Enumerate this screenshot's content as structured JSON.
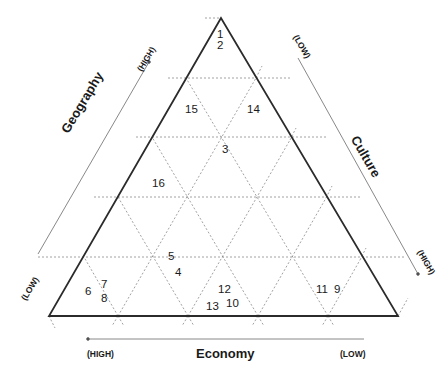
{
  "diagram": {
    "type": "ternary-triangle",
    "grid_divisions": 5,
    "colors": {
      "frame": "#2b2b2b",
      "grid": "#8a8a8a",
      "axis_line": "#7a7a7a",
      "text": "#1a1a1a"
    },
    "axes": {
      "geography": {
        "title": "Geography",
        "high": "(HIGH)",
        "low": "(LOW)"
      },
      "culture": {
        "title": "Culture",
        "high": "(HIGH)",
        "low": "(LOW)"
      },
      "economy": {
        "title": "Economy",
        "high": "(HIGH)",
        "low": "(LOW)"
      }
    },
    "points": [
      {
        "id": "1",
        "label": "1"
      },
      {
        "id": "2",
        "label": "2"
      },
      {
        "id": "3",
        "label": "3"
      },
      {
        "id": "4",
        "label": "4"
      },
      {
        "id": "5",
        "label": "5"
      },
      {
        "id": "6",
        "label": "6"
      },
      {
        "id": "7",
        "label": "7"
      },
      {
        "id": "8",
        "label": "8"
      },
      {
        "id": "9",
        "label": "9"
      },
      {
        "id": "10",
        "label": "10"
      },
      {
        "id": "11",
        "label": "11"
      },
      {
        "id": "12",
        "label": "12"
      },
      {
        "id": "13",
        "label": "13"
      },
      {
        "id": "14",
        "label": "14"
      },
      {
        "id": "15",
        "label": "15"
      },
      {
        "id": "16",
        "label": "16"
      }
    ]
  }
}
